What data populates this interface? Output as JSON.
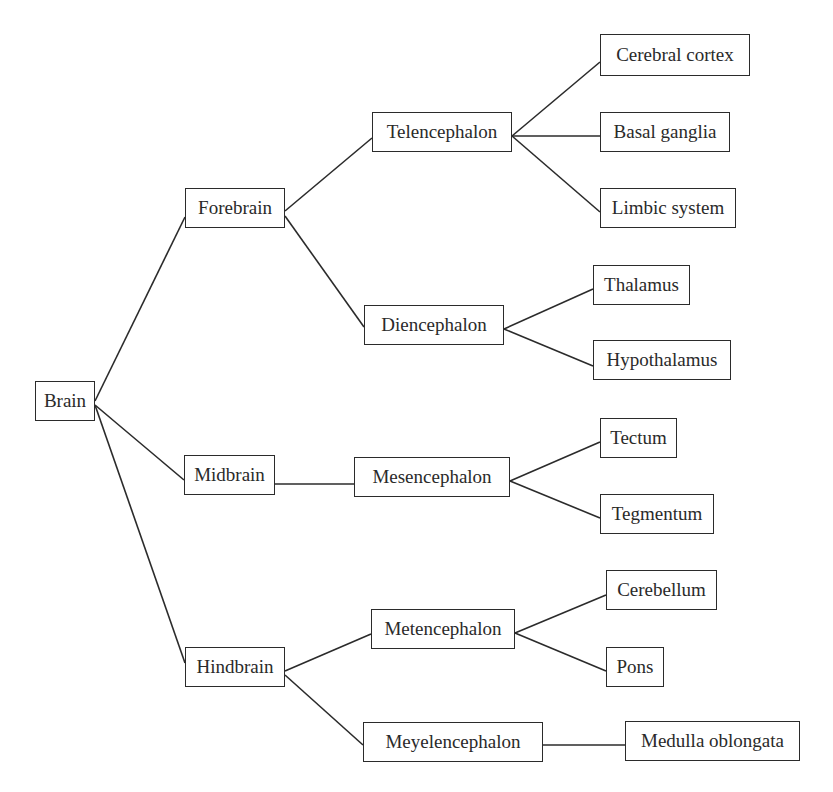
{
  "diagram": {
    "type": "tree",
    "direction": "left-to-right",
    "line_color": "#2b2b2b",
    "text_color": "#2a2a2a",
    "nodes": [
      {
        "id": "brain",
        "label": "Brain",
        "x": 35,
        "y": 381,
        "w": 60,
        "h": 40
      },
      {
        "id": "forebrain",
        "label": "Forebrain",
        "x": 185,
        "y": 188,
        "w": 100,
        "h": 40
      },
      {
        "id": "midbrain",
        "label": "Midbrain",
        "x": 184,
        "y": 455,
        "w": 91,
        "h": 40
      },
      {
        "id": "hindbrain",
        "label": "Hindbrain",
        "x": 185,
        "y": 647,
        "w": 100,
        "h": 40
      },
      {
        "id": "telencephalon",
        "label": "Telencephalon",
        "x": 372,
        "y": 112,
        "w": 140,
        "h": 40
      },
      {
        "id": "diencephalon",
        "label": "Diencephalon",
        "x": 364,
        "y": 305,
        "w": 140,
        "h": 40
      },
      {
        "id": "mesencephalon",
        "label": "Mesencephalon",
        "x": 354,
        "y": 457,
        "w": 156,
        "h": 40
      },
      {
        "id": "metencephalon",
        "label": "Metencephalon",
        "x": 371,
        "y": 609,
        "w": 144,
        "h": 40
      },
      {
        "id": "meyelencephalon",
        "label": "Meyelencephalon",
        "x": 363,
        "y": 722,
        "w": 180,
        "h": 40
      },
      {
        "id": "cerebral-cortex",
        "label": "Cerebral cortex",
        "x": 600,
        "y": 34,
        "w": 150,
        "h": 42
      },
      {
        "id": "basal-ganglia",
        "label": "Basal ganglia",
        "x": 600,
        "y": 112,
        "w": 130,
        "h": 40
      },
      {
        "id": "limbic-system",
        "label": "Limbic system",
        "x": 600,
        "y": 188,
        "w": 136,
        "h": 40
      },
      {
        "id": "thalamus",
        "label": "Thalamus",
        "x": 593,
        "y": 265,
        "w": 97,
        "h": 40
      },
      {
        "id": "hypothalamus",
        "label": "Hypothalamus",
        "x": 593,
        "y": 340,
        "w": 138,
        "h": 40
      },
      {
        "id": "tectum",
        "label": "Tectum",
        "x": 600,
        "y": 418,
        "w": 77,
        "h": 40
      },
      {
        "id": "tegmentum",
        "label": "Tegmentum",
        "x": 600,
        "y": 494,
        "w": 114,
        "h": 40
      },
      {
        "id": "cerebellum",
        "label": "Cerebellum",
        "x": 606,
        "y": 570,
        "w": 111,
        "h": 40
      },
      {
        "id": "pons",
        "label": "Pons",
        "x": 606,
        "y": 647,
        "w": 58,
        "h": 40
      },
      {
        "id": "medulla-oblongata",
        "label": "Medulla oblongata",
        "x": 625,
        "y": 721,
        "w": 175,
        "h": 40
      }
    ],
    "edges": [
      {
        "from": "brain",
        "to": "forebrain",
        "x1": 95,
        "y1": 401,
        "x2": 185,
        "y2": 217
      },
      {
        "from": "brain",
        "to": "midbrain",
        "x1": 95,
        "y1": 405,
        "x2": 184,
        "y2": 480
      },
      {
        "from": "brain",
        "to": "hindbrain",
        "x1": 95,
        "y1": 405,
        "x2": 185,
        "y2": 663
      },
      {
        "from": "forebrain",
        "to": "telencephalon",
        "x1": 285,
        "y1": 211,
        "x2": 372,
        "y2": 138
      },
      {
        "from": "forebrain",
        "to": "diencephalon",
        "x1": 285,
        "y1": 216,
        "x2": 364,
        "y2": 327
      },
      {
        "from": "midbrain",
        "to": "mesencephalon",
        "x1": 275,
        "y1": 484,
        "x2": 354,
        "y2": 484
      },
      {
        "from": "hindbrain",
        "to": "metencephalon",
        "x1": 285,
        "y1": 671,
        "x2": 371,
        "y2": 634
      },
      {
        "from": "hindbrain",
        "to": "meyelencephalon",
        "x1": 285,
        "y1": 675,
        "x2": 363,
        "y2": 745
      },
      {
        "from": "telencephalon",
        "to": "cerebral-cortex",
        "x1": 512,
        "y1": 136,
        "x2": 600,
        "y2": 62
      },
      {
        "from": "telencephalon",
        "to": "basal-ganglia",
        "x1": 512,
        "y1": 136,
        "x2": 600,
        "y2": 136
      },
      {
        "from": "telencephalon",
        "to": "limbic-system",
        "x1": 512,
        "y1": 136,
        "x2": 600,
        "y2": 212
      },
      {
        "from": "diencephalon",
        "to": "thalamus",
        "x1": 504,
        "y1": 329,
        "x2": 593,
        "y2": 289
      },
      {
        "from": "diencephalon",
        "to": "hypothalamus",
        "x1": 504,
        "y1": 329,
        "x2": 593,
        "y2": 366
      },
      {
        "from": "mesencephalon",
        "to": "tectum",
        "x1": 510,
        "y1": 481,
        "x2": 600,
        "y2": 442
      },
      {
        "from": "mesencephalon",
        "to": "tegmentum",
        "x1": 510,
        "y1": 481,
        "x2": 600,
        "y2": 518
      },
      {
        "from": "metencephalon",
        "to": "cerebellum",
        "x1": 515,
        "y1": 633,
        "x2": 606,
        "y2": 595
      },
      {
        "from": "metencephalon",
        "to": "pons",
        "x1": 515,
        "y1": 633,
        "x2": 606,
        "y2": 671
      },
      {
        "from": "meyelencephalon",
        "to": "medulla-oblongata",
        "x1": 543,
        "y1": 745,
        "x2": 625,
        "y2": 745
      }
    ]
  },
  "labels": {
    "brain": "Brain",
    "forebrain": "Forebrain",
    "midbrain": "Midbrain",
    "hindbrain": "Hindbrain",
    "telencephalon": "Telencephalon",
    "diencephalon": "Diencephalon",
    "mesencephalon": "Mesencephalon",
    "metencephalon": "Metencephalon",
    "meyelencephalon": "Meyelencephalon",
    "cerebral_cortex": "Cerebral cortex",
    "basal_ganglia": "Basal ganglia",
    "limbic_system": "Limbic system",
    "thalamus": "Thalamus",
    "hypothalamus": "Hypothalamus",
    "tectum": "Tectum",
    "tegmentum": "Tegmentum",
    "cerebellum": "Cerebellum",
    "pons": "Pons",
    "medulla_oblongata": "Medulla oblongata"
  }
}
